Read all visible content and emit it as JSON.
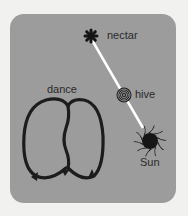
{
  "diagram": {
    "labels": {
      "nectar": "nectar",
      "hive": "hive",
      "sun": "Sun",
      "dance": "dance"
    },
    "colors": {
      "background": "#f1f1ef",
      "panel": "#9c9c9c",
      "ink": "#1e1e1e",
      "line": "#ffffff"
    }
  }
}
